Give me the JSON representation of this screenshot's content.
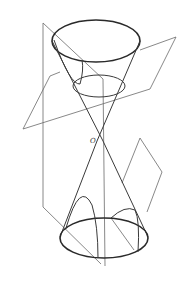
{
  "figure": {
    "apex_label": "O",
    "colors": {
      "background": "#ffffff",
      "line": "#3a3a3a",
      "plane": "#6a6a6a"
    },
    "elements": [
      "upper-nappe",
      "lower-nappe",
      "axis",
      "horizontal-plane-circle",
      "vertical-plane-hyperbola",
      "oblique-plane-parabola",
      "top-ellipse",
      "bottom-ellipse"
    ]
  }
}
